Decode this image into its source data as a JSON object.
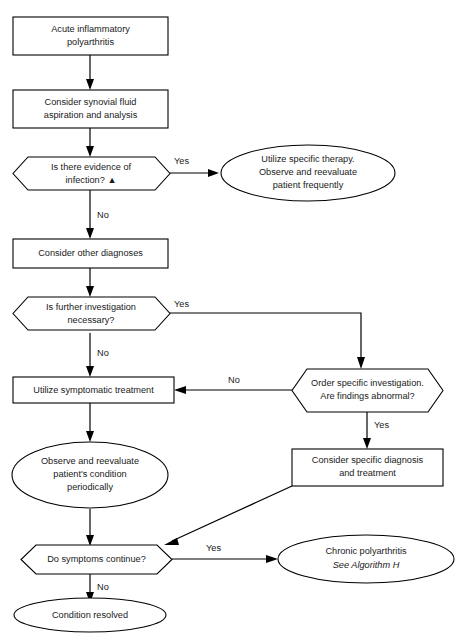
{
  "document": {
    "title": "Acute Inflammatory Polyarthritis Algorithm",
    "top_caption": "",
    "background_color": "#ffffff",
    "line_color": "#000000",
    "text_color": "#1a1a1a"
  },
  "nodes": {
    "start": {
      "id": "start",
      "shape": "rectangle",
      "line1": "Acute inflammatory",
      "line2": "polyarthritis"
    },
    "synovial": {
      "id": "synovial",
      "shape": "rectangle",
      "line1": "Consider synovial fluid",
      "line2": "aspiration and analysis"
    },
    "infection_q": {
      "id": "infection_q",
      "shape": "hexagon",
      "line1": "Is there evidence of",
      "line2": "infection? ▲"
    },
    "specific_therapy": {
      "id": "specific_therapy",
      "shape": "ellipse",
      "line1": "Utilize specific therapy.",
      "line2": "Observe and reevaluate",
      "line3": "patient frequently"
    },
    "other_dx": {
      "id": "other_dx",
      "shape": "rectangle",
      "line1": "Consider other diagnoses"
    },
    "further_inv_q": {
      "id": "further_inv_q",
      "shape": "hexagon",
      "line1": "Is further investigation",
      "line2": "necessary?"
    },
    "order_inv_q": {
      "id": "order_inv_q",
      "shape": "hexagon",
      "line1": "Order specific investigation.",
      "line2": "Are findings abnormal?"
    },
    "symptomatic": {
      "id": "symptomatic",
      "shape": "rectangle",
      "line1": "Utilize symptomatic treatment"
    },
    "specific_dx": {
      "id": "specific_dx",
      "shape": "rectangle",
      "line1": "Consider specific diagnosis",
      "line2": "and treatment"
    },
    "observe": {
      "id": "observe",
      "shape": "ellipse",
      "line1": "Observe and reevaluate",
      "line2": "patient's condition",
      "line3": "periodically"
    },
    "symptoms_q": {
      "id": "symptoms_q",
      "shape": "hexagon",
      "line1": "Do symptoms continue?"
    },
    "chronic": {
      "id": "chronic",
      "shape": "ellipse",
      "line1": "Chronic polyarthritis",
      "line2": "See Algorithm H",
      "line2_style": "italic"
    },
    "resolved": {
      "id": "resolved",
      "shape": "ellipse",
      "line1": "Condition resolved"
    }
  },
  "edge_labels": {
    "infection_yes": "Yes",
    "infection_no": "No",
    "further_yes": "Yes",
    "further_no": "No",
    "order_no": "No",
    "order_yes": "Yes",
    "symptoms_yes": "Yes",
    "symptoms_no": "No"
  },
  "flow_data": {
    "type": "flowchart",
    "edges": [
      {
        "from": "start",
        "to": "synovial",
        "label": ""
      },
      {
        "from": "synovial",
        "to": "infection_q",
        "label": ""
      },
      {
        "from": "infection_q",
        "to": "specific_therapy",
        "label": "Yes"
      },
      {
        "from": "infection_q",
        "to": "other_dx",
        "label": "No"
      },
      {
        "from": "other_dx",
        "to": "further_inv_q",
        "label": ""
      },
      {
        "from": "further_inv_q",
        "to": "order_inv_q",
        "label": "Yes"
      },
      {
        "from": "further_inv_q",
        "to": "symptomatic",
        "label": "No"
      },
      {
        "from": "order_inv_q",
        "to": "symptomatic",
        "label": "No"
      },
      {
        "from": "order_inv_q",
        "to": "specific_dx",
        "label": "Yes"
      },
      {
        "from": "symptomatic",
        "to": "observe",
        "label": ""
      },
      {
        "from": "observe",
        "to": "symptoms_q",
        "label": ""
      },
      {
        "from": "specific_dx",
        "to": "symptoms_q",
        "label": ""
      },
      {
        "from": "symptoms_q",
        "to": "chronic",
        "label": "Yes"
      },
      {
        "from": "symptoms_q",
        "to": "resolved",
        "label": "No"
      }
    ]
  }
}
